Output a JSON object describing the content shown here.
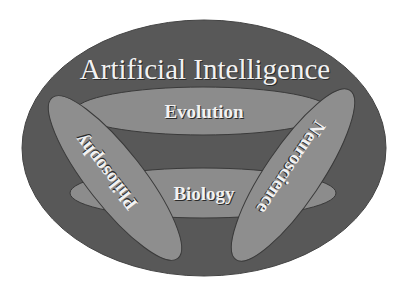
{
  "diagram": {
    "outer": {
      "label": "Artificial Intelligence",
      "fill": "#585858"
    },
    "regions": [
      {
        "id": "evolution",
        "label": "Evolution",
        "fill": "#8c8c8c"
      },
      {
        "id": "biology",
        "label": "Biology",
        "fill": "#8c8c8c"
      },
      {
        "id": "philosophy",
        "label": "Philosophy",
        "fill": "#8e8e8e"
      },
      {
        "id": "neuroscience",
        "label": "Neuroscience",
        "fill": "#8e8e8e"
      }
    ],
    "colors": {
      "background": "#ffffff",
      "outline": "#3a3a3a",
      "text": "#f2f2f2"
    }
  }
}
